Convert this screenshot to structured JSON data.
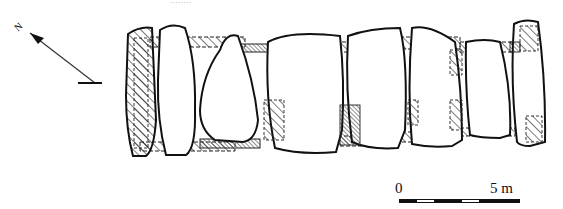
{
  "header": {
    "text": "........"
  },
  "north_arrow": {
    "label": "N"
  },
  "scale_bar": {
    "start_label": "0",
    "end_label": "5 m"
  },
  "plan": {
    "type": "megalithic tomb ground plan",
    "stones_count": 8,
    "colors": {
      "line": "#111111",
      "background": "#ffffff"
    }
  }
}
